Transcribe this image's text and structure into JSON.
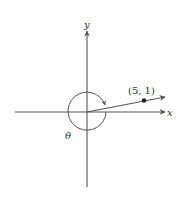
{
  "diagram": {
    "axes": {
      "x_label": "x",
      "y_label": "y"
    },
    "point": {
      "label": "(5, 1)",
      "x": 5,
      "y": 1
    },
    "angle": {
      "label": "θ",
      "direction": "clockwise",
      "description": "negative angle from positive x-axis, nearly full clockwise rotation to terminal ray through (5, 1)"
    },
    "colors": {
      "line": "#555555",
      "text": "#333333",
      "background": "#ffffff"
    }
  }
}
